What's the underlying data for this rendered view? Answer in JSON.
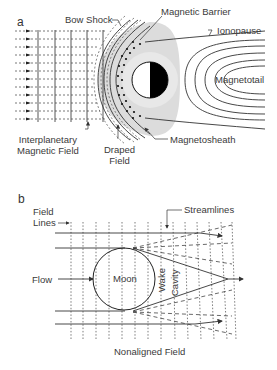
{
  "panel_a": {
    "letter": "a",
    "labels": {
      "bow_shock": "Bow Shock",
      "magnetic_barrier": "Magnetic Barrier",
      "ionopause": "Ionopause",
      "magnetotail": "Magnetotail",
      "imf_line1": "Interplanetary",
      "imf_line2": "Magnetic Field",
      "draped_line1": "Draped",
      "draped_line2": "Field",
      "magnetosheath": "Magnetosheath"
    }
  },
  "panel_b": {
    "letter": "b",
    "labels": {
      "field_line1": "Field",
      "field_line2": "Lines",
      "streamlines": "Streamlines",
      "flow": "Flow",
      "moon": "Moon",
      "wake": "Wake",
      "cavity": "Cavity",
      "caption": "Nonaligned Field"
    }
  },
  "colors": {
    "line": "#333333",
    "sheath_gray": "#d9d9d9",
    "planet_dark": "#000000"
  }
}
